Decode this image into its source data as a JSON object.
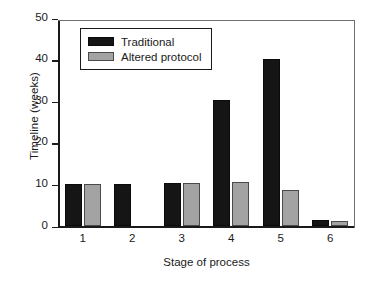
{
  "chart_data": {
    "type": "bar",
    "title": "",
    "xlabel": "Stage of process",
    "ylabel": "Timeline (weeks)",
    "categories": [
      "1",
      "2",
      "3",
      "4",
      "5",
      "6"
    ],
    "series": [
      {
        "name": "Traditional",
        "color": "#151515",
        "values": [
          10.2,
          10.3,
          10.4,
          30.5,
          40.3,
          1.5
        ]
      },
      {
        "name": "Altered protocol",
        "color": "#a3a3a3",
        "values": [
          10.2,
          0,
          10.4,
          10.6,
          8.7,
          1.4
        ]
      }
    ],
    "ylim": [
      0,
      50
    ],
    "yticks": [
      0,
      10,
      20,
      30,
      40,
      50
    ],
    "ytick_labels": [
      "0",
      "10",
      "20",
      "30",
      "40",
      "50"
    ],
    "grid": false,
    "legend_position": "upper left"
  },
  "legend": {
    "entries": [
      {
        "label": "Traditional"
      },
      {
        "label": "Altered protocol"
      }
    ]
  }
}
